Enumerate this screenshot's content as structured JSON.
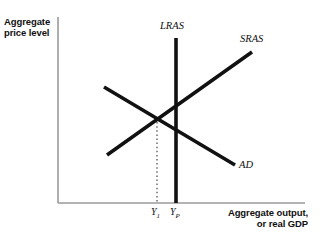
{
  "figure": {
    "type": "ad-as-macroeconomic-diagram",
    "background_color": "#ffffff",
    "width": 324,
    "height": 250
  },
  "axes": {
    "y_axis_title": "Aggregate\nprice level",
    "x_axis_title": "Aggregate output,\nor real GDP",
    "line_color": "#9a9a9a",
    "origin_x": 58,
    "origin_y": 203,
    "x_axis_end": 305,
    "y_axis_top": 17
  },
  "curves": [
    {
      "id": "lras",
      "label": "LRAS",
      "meaning": "long-run aggregate supply",
      "color": "#111111",
      "stroke_width": 3.6,
      "x1": 176,
      "y1": 38,
      "x2": 176,
      "y2": 203
    },
    {
      "id": "sras",
      "label": "SRAS",
      "meaning": "short-run aggregate supply",
      "color": "#111111",
      "stroke_width": 3.6,
      "x1": 107,
      "y1": 155,
      "x2": 252,
      "y2": 52
    },
    {
      "id": "ad",
      "label": "AD",
      "meaning": "aggregate demand",
      "color": "#111111",
      "stroke_width": 3.6,
      "x1": 104,
      "y1": 87,
      "x2": 235,
      "y2": 165
    }
  ],
  "guide_line": {
    "id": "y1-dropline",
    "style": "dotted",
    "color": "#555555",
    "x": 157,
    "y_top": 118,
    "y_bottom": 203
  },
  "equilibrium": {
    "id": "short-run-equilibrium",
    "x": 157,
    "y": 118,
    "description": "AD intersects SRAS left of LRAS (recessionary gap)"
  },
  "tick_labels": [
    {
      "id": "y1",
      "text": "Y",
      "subscript": "1",
      "x": 157
    },
    {
      "id": "yp",
      "text": "Y",
      "subscript": "P",
      "x": 176
    }
  ]
}
